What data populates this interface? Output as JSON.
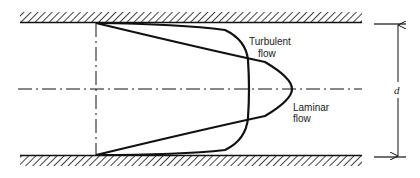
{
  "diagram": {
    "type": "velocity-profile",
    "labels": {
      "turbulent_line1": "Turbulent",
      "turbulent_line2": "flow",
      "laminar_line1": "Laminar",
      "laminar_line2": "flow",
      "dimension": "d"
    },
    "colors": {
      "stroke": "#111111",
      "background": "#ffffff"
    },
    "elements": [
      "top-pipe-wall",
      "bottom-pipe-wall",
      "centerline",
      "inlet-reference-line",
      "laminar-profile",
      "turbulent-profile",
      "diameter-dimension"
    ]
  }
}
